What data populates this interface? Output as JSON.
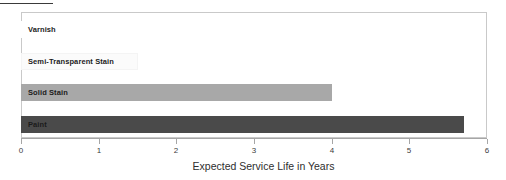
{
  "chart_data": {
    "type": "bar",
    "orientation": "horizontal",
    "title": "",
    "xlabel": "Expected Service Life in Years",
    "ylabel": "",
    "xlim": [
      0,
      6
    ],
    "xticks": [
      0,
      1,
      2,
      3,
      4,
      5,
      6
    ],
    "xtick_labels": [
      "0",
      "1",
      "2",
      "3",
      "4",
      "5",
      "6"
    ],
    "grid": false,
    "legend": null,
    "categories": [
      "Varnish",
      "Semi-Transparent Stain",
      "Solid Stain",
      "Paint"
    ],
    "values": [
      0.9,
      1.5,
      4.0,
      5.7
    ],
    "bar_colors": [
      "#ffffff",
      "#fbfbfb",
      "#a8a8a8",
      "#4a4a4a"
    ],
    "bar_border_colors": [
      "#ffffff",
      "#f4f4f4",
      "#a8a8a8",
      "#4a4a4a"
    ],
    "label_color": "#1b1b1b",
    "bars": [
      {
        "category": "Varnish",
        "value": 0.9,
        "color": "#ffffff"
      },
      {
        "category": "Semi-Transparent Stain",
        "value": 1.5,
        "color": "#fbfbfb"
      },
      {
        "category": "Solid Stain",
        "value": 4.0,
        "color": "#a8a8a8"
      },
      {
        "category": "Paint",
        "value": 5.7,
        "color": "#4a4a4a"
      }
    ]
  },
  "axis": {
    "title": "Expected Service Life in Years",
    "ticks": [
      "0",
      "1",
      "2",
      "3",
      "4",
      "5",
      "6"
    ]
  },
  "bars": [
    {
      "label": "Varnish"
    },
    {
      "label": "Semi-Transparent Stain"
    },
    {
      "label": "Solid Stain"
    },
    {
      "label": "Paint"
    }
  ]
}
